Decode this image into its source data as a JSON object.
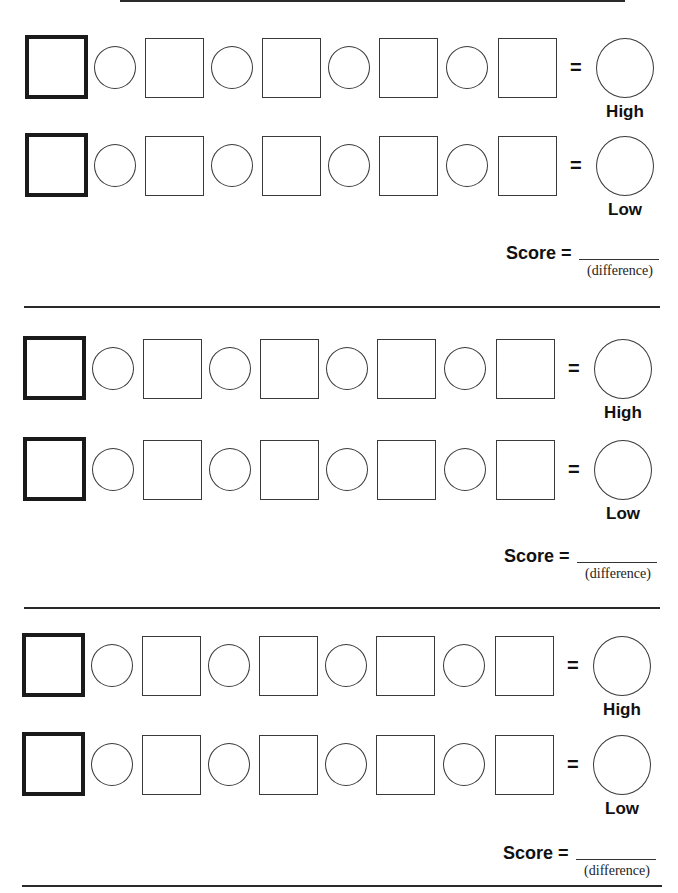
{
  "worksheet": {
    "sections": [
      {
        "high_row": {
          "equals": "=",
          "result_label": "High"
        },
        "low_row": {
          "equals": "=",
          "result_label": "Low"
        },
        "score": {
          "label": "Score =",
          "blank_caption": "(difference)"
        }
      },
      {
        "high_row": {
          "equals": "=",
          "result_label": "High"
        },
        "low_row": {
          "equals": "=",
          "result_label": "Low"
        },
        "score": {
          "label": "Score =",
          "blank_caption": "(difference)"
        }
      },
      {
        "high_row": {
          "equals": "=",
          "result_label": "High"
        },
        "low_row": {
          "equals": "=",
          "result_label": "Low"
        },
        "score": {
          "label": "Score =",
          "blank_caption": "(difference)"
        }
      }
    ],
    "row_structure": {
      "number_boxes_per_row": 5,
      "operator_circles_per_row": 4,
      "result_circles_per_row": 1
    }
  }
}
